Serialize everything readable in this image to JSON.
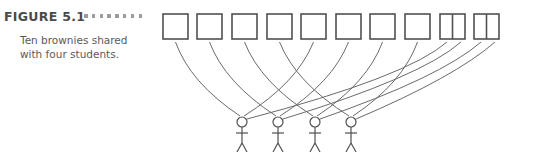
{
  "figure": {
    "label": "FIGURE 5.1",
    "caption": "Ten brownies shared with four students."
  },
  "diagram": {
    "brownies": [
      {
        "index": 1,
        "x": 163,
        "halved": false
      },
      {
        "index": 2,
        "x": 197,
        "halved": false
      },
      {
        "index": 3,
        "x": 232,
        "halved": false
      },
      {
        "index": 4,
        "x": 267,
        "halved": false
      },
      {
        "index": 5,
        "x": 301,
        "halved": false
      },
      {
        "index": 6,
        "x": 336,
        "halved": false
      },
      {
        "index": 7,
        "x": 370,
        "halved": false
      },
      {
        "index": 8,
        "x": 405,
        "halved": false
      },
      {
        "index": 9,
        "x": 440,
        "halved": true
      },
      {
        "index": 10,
        "x": 474,
        "halved": true
      }
    ],
    "students": [
      {
        "index": 1,
        "x": 242
      },
      {
        "index": 2,
        "x": 278
      },
      {
        "index": 3,
        "x": 315
      },
      {
        "index": 4,
        "x": 351
      }
    ],
    "line_color": "#6a6a6a",
    "box_color": "#505050"
  }
}
